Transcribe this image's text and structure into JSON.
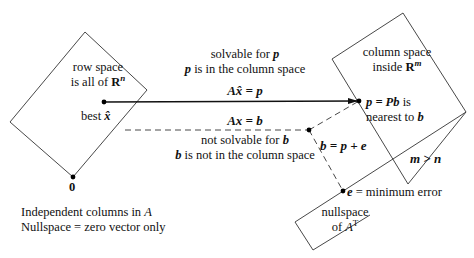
{
  "row_space": {
    "line1": "row space",
    "line2_prefix": "is all of ",
    "line2_set": "R",
    "line2_sup": "n",
    "point_label_prefix": "best ",
    "point_label_var": "x̂"
  },
  "origin": {
    "label": "0"
  },
  "bottom_note": {
    "line1_prefix": "Independent columns in ",
    "line1_var": "A",
    "line2": "Nullspace = zero vector only"
  },
  "arrow": {
    "caption1_prefix": "solvable for ",
    "caption1_var": "p",
    "caption2_var": "p",
    "caption2_suffix": " is in the column space",
    "equation": "Ax̂ = p"
  },
  "dashed": {
    "equation": "Ax = b",
    "caption1_prefix": "not solvable for ",
    "caption1_var": "b",
    "caption2_var": "b",
    "caption2_suffix": " is not in the column space"
  },
  "column_space": {
    "line1": "column space",
    "line2_prefix": "inside ",
    "line2_set": "R",
    "line2_sup": "m",
    "p_eq": "p = Pb",
    "p_eq_suffix": " is",
    "p_line2_prefix": "nearest to ",
    "p_line2_var": "b"
  },
  "decomposition": {
    "equation": "b = p + e"
  },
  "dimension_note": {
    "text": "m > n"
  },
  "error": {
    "eq_var": "e",
    "eq_rest": " = minimum error"
  },
  "nullspace": {
    "line1": "nullspace",
    "line2_prefix": "of ",
    "line2_var": "A",
    "line2_sup": "T"
  },
  "colors": {
    "stroke": "#222222",
    "background": "#ffffff"
  }
}
